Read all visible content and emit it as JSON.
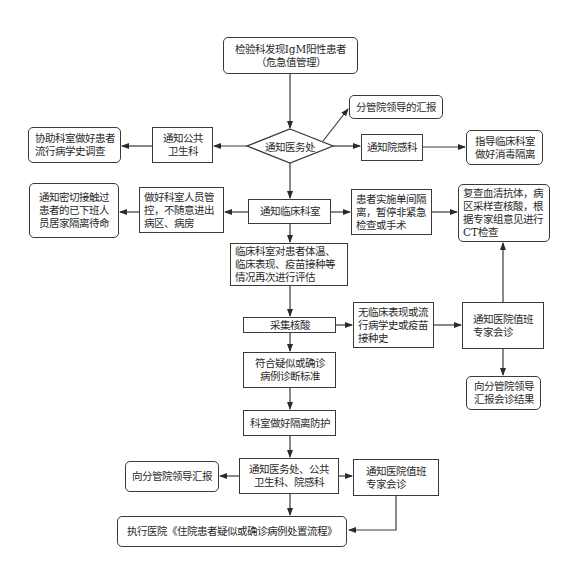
{
  "diagram": {
    "type": "flowchart",
    "line_color": "#3a3a3a",
    "nodes": {
      "start": {
        "shape": "rounded-rect",
        "line1": "检验科发现IgM阳性患者",
        "line2": "（危急值管理）"
      },
      "decision_medical_affairs": {
        "shape": "diamond",
        "label": "通知医务处"
      },
      "report_leader": {
        "shape": "rounded-rect",
        "label": "分管院领导的汇报"
      },
      "notify_infection_dept": {
        "shape": "rect",
        "label": "通知院感科"
      },
      "guide_disinfection": {
        "shape": "rounded-rect",
        "line1": "指导临床科室",
        "line2": "做好消毒隔离"
      },
      "notify_public_health": {
        "shape": "rect",
        "line1": "通知公共",
        "line2": "卫生科"
      },
      "assist_epi_investigation": {
        "shape": "rounded-rect",
        "line1": "协助科室做好患者",
        "line2": "流行病学史调查"
      },
      "notify_clinical_dept": {
        "shape": "rect",
        "label": "通知临床科室"
      },
      "staff_control": {
        "shape": "rect",
        "text": "做好科室人员管控，不随意进出病区、病房"
      },
      "notify_close_contacts": {
        "shape": "rounded-rect",
        "text": "通知密切接触过患者的已下班人员居家隔离待命"
      },
      "single_room_isolation": {
        "shape": "rect",
        "text": "患者实施单间隔离，暂停非紧急检查或手术"
      },
      "recheck_antibody": {
        "shape": "rounded-rect",
        "text": "复查血清抗体，病区采样查核酸，根据专家组意见进行CT检查"
      },
      "re_evaluate": {
        "shape": "rect",
        "text": "临床科室对患者体温、临床表现、疫苗接种等情况再次进行评估"
      },
      "collect_nucleic_acid": {
        "shape": "rect",
        "label": "采集核酸"
      },
      "no_clinical_history": {
        "shape": "rect",
        "text": "无临床表现或流行病学史或疫苗接种史"
      },
      "notify_expert_consult_right": {
        "shape": "rect",
        "line1": "通知医院值班",
        "line2": "专家会诊"
      },
      "report_consult_result": {
        "shape": "rounded-rect",
        "line1": "向分管院领导",
        "line2": "汇报会诊结果"
      },
      "meets_diagnosis_criteria": {
        "shape": "rect",
        "line1": "符合疑似或确诊",
        "line2": "病例诊断标准"
      },
      "dept_isolation_protection": {
        "shape": "rect",
        "label": "科室做好隔离防护"
      },
      "notify_three_depts": {
        "shape": "rect",
        "line1": "通知医务处、公共",
        "line2": "卫生科、院感科"
      },
      "report_leader_bottom": {
        "shape": "rounded-rect",
        "label": "向分管院领导汇报"
      },
      "notify_expert_consult_bottom": {
        "shape": "rect",
        "line1": "通知医院值班",
        "line2": "专家会诊"
      },
      "execute_procedure": {
        "shape": "rounded-rect",
        "label": "执行医院《住院患者疑似或确诊病例处置流程》"
      }
    },
    "edges": [
      [
        "start",
        "decision_medical_affairs"
      ],
      [
        "decision_medical_affairs",
        "report_leader"
      ],
      [
        "decision_medical_affairs",
        "notify_infection_dept"
      ],
      [
        "notify_infection_dept",
        "guide_disinfection"
      ],
      [
        "decision_medical_affairs",
        "notify_public_health"
      ],
      [
        "notify_public_health",
        "assist_epi_investigation"
      ],
      [
        "decision_medical_affairs",
        "notify_clinical_dept"
      ],
      [
        "notify_clinical_dept",
        "staff_control"
      ],
      [
        "staff_control",
        "notify_close_contacts"
      ],
      [
        "notify_clinical_dept",
        "single_room_isolation"
      ],
      [
        "single_room_isolation",
        "recheck_antibody"
      ],
      [
        "notify_clinical_dept",
        "re_evaluate"
      ],
      [
        "re_evaluate",
        "collect_nucleic_acid"
      ],
      [
        "collect_nucleic_acid",
        "no_clinical_history"
      ],
      [
        "no_clinical_history",
        "notify_expert_consult_right"
      ],
      [
        "notify_expert_consult_right",
        "recheck_antibody"
      ],
      [
        "notify_expert_consult_right",
        "report_consult_result"
      ],
      [
        "collect_nucleic_acid",
        "meets_diagnosis_criteria"
      ],
      [
        "meets_diagnosis_criteria",
        "dept_isolation_protection"
      ],
      [
        "dept_isolation_protection",
        "notify_three_depts"
      ],
      [
        "notify_three_depts",
        "report_leader_bottom"
      ],
      [
        "notify_three_depts",
        "notify_expert_consult_bottom"
      ],
      [
        "notify_three_depts",
        "execute_procedure"
      ],
      [
        "notify_expert_consult_bottom",
        "execute_procedure"
      ]
    ]
  }
}
